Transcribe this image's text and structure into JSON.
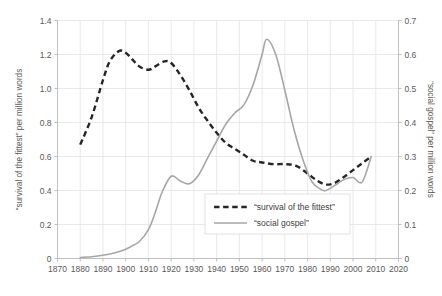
{
  "chart_data": {
    "type": "line",
    "title": "",
    "xlabel": "",
    "ylabel": "“survival of the fittest” per million words",
    "y2label": "“social gospel” per million words",
    "xlim": [
      1870,
      2020
    ],
    "ylim": [
      0,
      1.4
    ],
    "y2lim": [
      0,
      0.7
    ],
    "grid": true,
    "legend_position": "center-right-inside",
    "xticks": [
      1870,
      1880,
      1890,
      1900,
      1910,
      1920,
      1930,
      1940,
      1950,
      1960,
      1970,
      1980,
      1990,
      2000,
      2010,
      2020
    ],
    "xtick_labels": [
      "1870",
      "1880",
      "1890",
      "1900",
      "1910",
      "1920",
      "1930",
      "1940",
      "1950",
      "1960",
      "1970",
      "1980",
      "1990",
      "2000",
      "2010",
      "2020"
    ],
    "yticks": [
      0,
      0.2,
      0.4,
      0.6,
      0.8,
      1.0,
      1.2,
      1.4
    ],
    "ytick_labels": [
      "0",
      "0.2",
      "0.4",
      "0.6",
      "0.8",
      "1.0",
      "1.2",
      "1.4"
    ],
    "y2ticks": [
      0,
      0.1,
      0.2,
      0.3,
      0.4,
      0.5,
      0.6,
      0.7
    ],
    "y2tick_labels": [
      "0",
      "0.1",
      "0.2",
      "0.3",
      "0.4",
      "0.5",
      "0.6",
      "0.7"
    ],
    "series": [
      {
        "name": "“survival of the fittest”",
        "axis": "left",
        "style": "dashed",
        "color": "#262626",
        "x": [
          1880,
          1885,
          1890,
          1893,
          1897,
          1900,
          1903,
          1906,
          1910,
          1913,
          1917,
          1920,
          1924,
          1928,
          1932,
          1936,
          1940,
          1944,
          1948,
          1952,
          1956,
          1960,
          1965,
          1970,
          1975,
          1980,
          1984,
          1988,
          1992,
          1996,
          2000,
          2004,
          2008
        ],
        "values": [
          0.67,
          0.83,
          1.05,
          1.16,
          1.22,
          1.21,
          1.17,
          1.13,
          1.11,
          1.13,
          1.16,
          1.15,
          1.08,
          0.99,
          0.89,
          0.81,
          0.74,
          0.68,
          0.645,
          0.61,
          0.575,
          0.565,
          0.555,
          0.555,
          0.545,
          0.5,
          0.46,
          0.435,
          0.445,
          0.48,
          0.52,
          0.56,
          0.6
        ]
      },
      {
        "name": "“social gospel”",
        "axis": "right",
        "style": "solid",
        "color": "#a6a6a6",
        "x": [
          1880,
          1886,
          1892,
          1898,
          1902,
          1906,
          1910,
          1913,
          1916,
          1920,
          1924,
          1928,
          1932,
          1936,
          1940,
          1944,
          1948,
          1952,
          1956,
          1960,
          1962,
          1966,
          1970,
          1974,
          1978,
          1982,
          1986,
          1988,
          1992,
          1996,
          2000,
          2004,
          2008
        ],
        "values": [
          0.003,
          0.006,
          0.012,
          0.022,
          0.034,
          0.05,
          0.085,
          0.135,
          0.195,
          0.242,
          0.228,
          0.22,
          0.245,
          0.295,
          0.345,
          0.395,
          0.428,
          0.452,
          0.51,
          0.6,
          0.645,
          0.6,
          0.495,
          0.38,
          0.29,
          0.225,
          0.203,
          0.2,
          0.215,
          0.232,
          0.238,
          0.225,
          0.3
        ]
      }
    ]
  },
  "legend": {
    "items": [
      {
        "label": "“survival of the fittest”",
        "style": "dashed",
        "color": "#262626"
      },
      {
        "label": "“social gospel”",
        "style": "solid",
        "color": "#a6a6a6"
      }
    ]
  },
  "colors": {
    "background": "#ffffff",
    "grid": "#e3e3e3",
    "axis": "#bfbfbf",
    "text": "#595959",
    "series_dashed": "#262626",
    "series_solid": "#a6a6a6"
  }
}
